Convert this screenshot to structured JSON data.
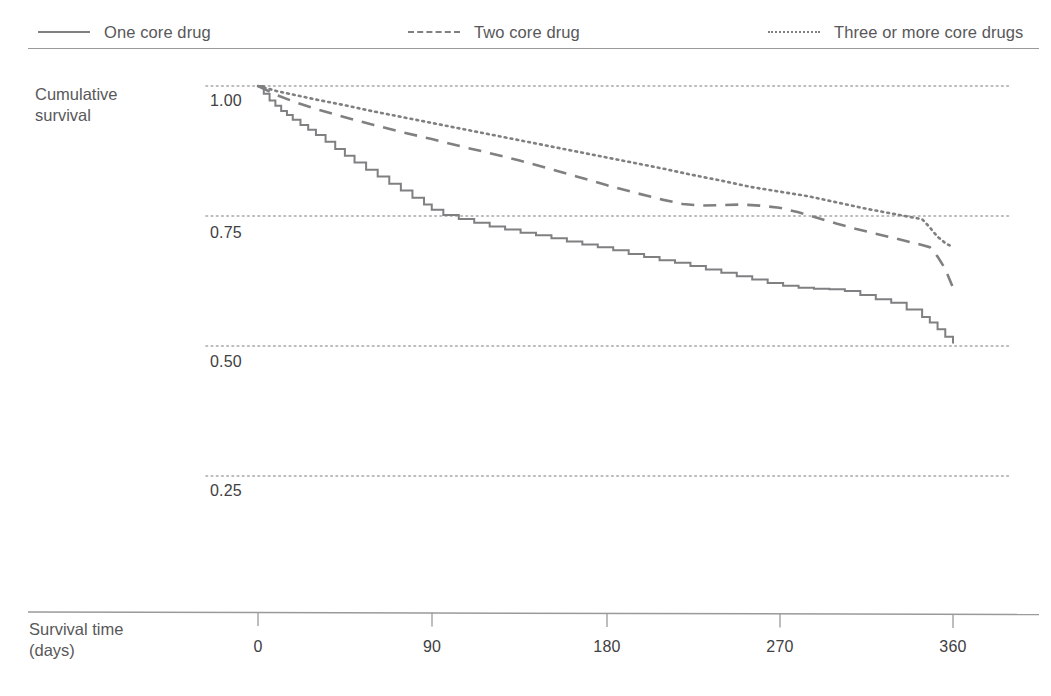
{
  "legend": {
    "items": [
      {
        "label": "One core drug",
        "style": "solid",
        "color": "#808083"
      },
      {
        "label": "Two core drug",
        "style": "dashed",
        "color": "#808083"
      },
      {
        "label": "Three or more core drugs",
        "style": "dotted",
        "color": "#808083"
      }
    ]
  },
  "axes": {
    "y_title": "Cumulative\nsurvival",
    "x_title": "Survival time\n(days)",
    "y_ticks": [
      "1.00",
      "0.75",
      "0.50",
      "0.25"
    ],
    "x_ticks": [
      "0",
      "90",
      "180",
      "270",
      "360"
    ]
  },
  "chart_data": {
    "type": "line",
    "title": "",
    "subtitle": "",
    "xlabel": "Survival time (days)",
    "ylabel": "Cumulative survival",
    "xlim": [
      0,
      360
    ],
    "ylim": [
      0.25,
      1.0
    ],
    "xticks": [
      0,
      90,
      180,
      270,
      360
    ],
    "yticks": [
      0.25,
      0.5,
      0.75,
      1.0
    ],
    "grid": "horizontal-dotted",
    "legend_position": "top",
    "note": "Kaplan-Meier style step / survival curves; all series start at 1.00 on day 0",
    "series": [
      {
        "name": "One core drug",
        "style": "solid",
        "color": "#808083",
        "step": true,
        "x": [
          0,
          3,
          6,
          9,
          12,
          15,
          18,
          22,
          26,
          30,
          35,
          40,
          45,
          50,
          56,
          62,
          68,
          74,
          80,
          86,
          90,
          96,
          104,
          112,
          120,
          128,
          136,
          144,
          152,
          160,
          168,
          176,
          184,
          192,
          200,
          208,
          216,
          224,
          232,
          240,
          248,
          256,
          264,
          272,
          280,
          288,
          296,
          304,
          312,
          320,
          328,
          336,
          344,
          348,
          352,
          356,
          360
        ],
        "y": [
          1.0,
          0.985,
          0.972,
          0.962,
          0.952,
          0.944,
          0.935,
          0.925,
          0.916,
          0.906,
          0.893,
          0.879,
          0.866,
          0.853,
          0.839,
          0.826,
          0.812,
          0.799,
          0.785,
          0.772,
          0.762,
          0.752,
          0.744,
          0.737,
          0.73,
          0.724,
          0.718,
          0.713,
          0.707,
          0.701,
          0.695,
          0.69,
          0.684,
          0.677,
          0.671,
          0.665,
          0.66,
          0.654,
          0.647,
          0.641,
          0.634,
          0.628,
          0.621,
          0.616,
          0.612,
          0.61,
          0.609,
          0.606,
          0.598,
          0.59,
          0.583,
          0.57,
          0.556,
          0.545,
          0.532,
          0.518,
          0.505
        ]
      },
      {
        "name": "Two core drug",
        "style": "dashed",
        "color": "#808083",
        "step": false,
        "x": [
          0,
          10,
          20,
          30,
          45,
          60,
          75,
          90,
          105,
          120,
          135,
          150,
          165,
          180,
          195,
          210,
          220,
          230,
          240,
          250,
          260,
          270,
          280,
          290,
          300,
          310,
          320,
          330,
          340,
          348,
          352,
          356,
          360
        ],
        "y": [
          1.0,
          0.982,
          0.968,
          0.956,
          0.94,
          0.925,
          0.911,
          0.898,
          0.884,
          0.871,
          0.857,
          0.842,
          0.826,
          0.81,
          0.795,
          0.781,
          0.773,
          0.77,
          0.771,
          0.772,
          0.77,
          0.766,
          0.757,
          0.746,
          0.735,
          0.725,
          0.716,
          0.707,
          0.698,
          0.69,
          0.672,
          0.648,
          0.612
        ]
      },
      {
        "name": "Three or more core drugs",
        "style": "dotted",
        "color": "#808083",
        "step": false,
        "x": [
          0,
          10,
          20,
          30,
          45,
          60,
          75,
          90,
          105,
          120,
          135,
          150,
          165,
          180,
          195,
          210,
          225,
          240,
          255,
          265,
          275,
          285,
          295,
          305,
          315,
          325,
          335,
          344,
          348,
          352,
          356,
          360
        ],
        "y": [
          1.0,
          0.99,
          0.982,
          0.974,
          0.963,
          0.951,
          0.94,
          0.929,
          0.918,
          0.907,
          0.896,
          0.885,
          0.874,
          0.863,
          0.852,
          0.841,
          0.829,
          0.818,
          0.806,
          0.8,
          0.794,
          0.788,
          0.78,
          0.772,
          0.764,
          0.757,
          0.75,
          0.744,
          0.728,
          0.71,
          0.698,
          0.69
        ]
      }
    ]
  }
}
